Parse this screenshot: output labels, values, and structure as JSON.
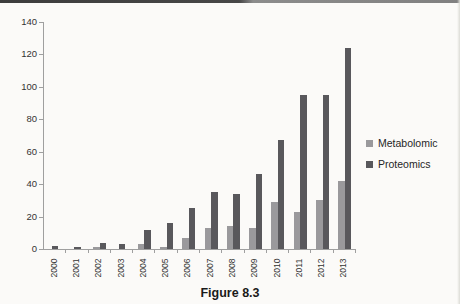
{
  "page": {
    "caption": "Figure 8.3"
  },
  "chart_data": {
    "type": "bar",
    "title": "",
    "xlabel": "",
    "ylabel": "",
    "categories": [
      "2000",
      "2001",
      "2002",
      "2003",
      "2004",
      "2005",
      "2006",
      "2007",
      "2008",
      "2009",
      "2010",
      "2011",
      "2012",
      "2013"
    ],
    "series": [
      {
        "name": "Metabolomic",
        "color": "#9a999c",
        "values": [
          0,
          0,
          1,
          0,
          3,
          1,
          7,
          13,
          14,
          13,
          29,
          23,
          30,
          42
        ]
      },
      {
        "name": "Proteomics",
        "color": "#59585c",
        "values": [
          2,
          1,
          4,
          3,
          12,
          16,
          25,
          35,
          34,
          46,
          67,
          95,
          95,
          124
        ]
      }
    ],
    "ylim": [
      0,
      140
    ],
    "y_ticks": [
      0,
      20,
      40,
      60,
      80,
      100,
      120,
      140
    ],
    "grid": false,
    "legend_position": "right"
  }
}
